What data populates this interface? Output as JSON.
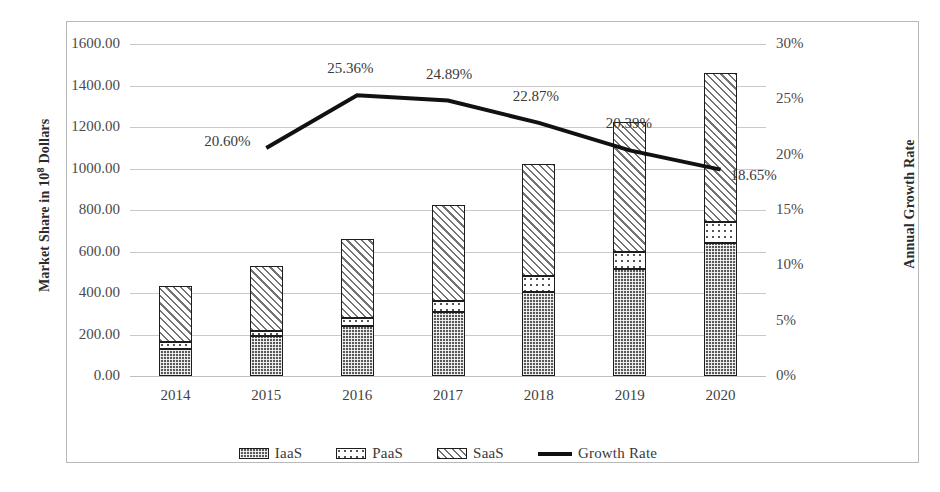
{
  "chart_data": {
    "type": "bar",
    "title": "",
    "subtitle": "",
    "xlabel": "",
    "ylabel": "Market Share in 10^8 Dollars",
    "ylabel_prefix": "Market Share in 10",
    "ylabel_sup": "8",
    "ylabel_suffix": " Dollars",
    "y2label": "Annual Growth Rate",
    "categories": [
      "2014",
      "2015",
      "2016",
      "2017",
      "2018",
      "2019",
      "2020"
    ],
    "ylim": [
      0,
      1600
    ],
    "yticks": [
      "0.00",
      "200.00",
      "400.00",
      "600.00",
      "800.00",
      "1000.00",
      "1200.00",
      "1400.00",
      "1600.00"
    ],
    "ytick_values": [
      0,
      200,
      400,
      600,
      800,
      1000,
      1200,
      1400,
      1600
    ],
    "y2lim": [
      0,
      30
    ],
    "y2ticks": [
      "0%",
      "5%",
      "10%",
      "15%",
      "20%",
      "25%",
      "30%"
    ],
    "y2tick_values": [
      0,
      5,
      10,
      15,
      20,
      25,
      30
    ],
    "grid": true,
    "stacked": true,
    "legend_position": "bottom",
    "series": [
      {
        "name": "IaaS",
        "axis": "left",
        "kind": "bar",
        "values": [
          130,
          195,
          240,
          310,
          405,
          515,
          640
        ]
      },
      {
        "name": "PaaS",
        "axis": "left",
        "kind": "bar",
        "values": [
          35,
          20,
          40,
          50,
          75,
          85,
          100
        ]
      },
      {
        "name": "SaaS",
        "axis": "left",
        "kind": "bar",
        "values": [
          270,
          315,
          380,
          465,
          540,
          625,
          720
        ]
      },
      {
        "name": "Growth Rate",
        "axis": "right",
        "kind": "line",
        "x": [
          "2015",
          "2016",
          "2017",
          "2018",
          "2019",
          "2020"
        ],
        "values": [
          20.6,
          25.36,
          24.89,
          22.87,
          20.39,
          18.65
        ],
        "labels": [
          "20.60%",
          "25.36%",
          "24.89%",
          "22.87%",
          "20.39%",
          "18.65%"
        ]
      }
    ],
    "totals": [
      435,
      530,
      660,
      825,
      1020,
      1225,
      1460
    ],
    "annotations": [
      {
        "text": "20.60%",
        "series": "Growth Rate",
        "x": "2015"
      },
      {
        "text": "25.36%",
        "series": "Growth Rate",
        "x": "2016"
      },
      {
        "text": "24.89%",
        "series": "Growth Rate",
        "x": "2017"
      },
      {
        "text": "22.87%",
        "series": "Growth Rate",
        "x": "2018"
      },
      {
        "text": "20.39%",
        "series": "Growth Rate",
        "x": "2019"
      },
      {
        "text": "18.65%",
        "series": "Growth Rate",
        "x": "2020"
      }
    ],
    "colors": {
      "bar_outline": "#1d1d1d",
      "iaas_fill": "#5a5a5a",
      "paas_fill": "#ffffff",
      "saas_fill": "#ffffff",
      "line": "#111111",
      "grid": "#c9c9c9",
      "text": "#3a3a3a"
    }
  },
  "legend": {
    "items": [
      {
        "label": "IaaS",
        "marker": "iaas-swatch"
      },
      {
        "label": "PaaS",
        "marker": "paas-swatch"
      },
      {
        "label": "SaaS",
        "marker": "saas-swatch"
      },
      {
        "label": "Growth Rate",
        "marker": "line-swatch"
      }
    ]
  }
}
